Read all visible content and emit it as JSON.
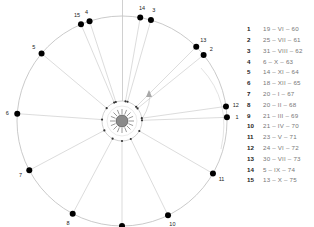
{
  "diagram": {
    "title": "",
    "center_label": "sun",
    "colors": {
      "orbit": "#bdbdbd",
      "line": "#c4c4c4",
      "point": "#000000",
      "sun_fill": "#8a8a8a",
      "sun_ray": "#555555",
      "label": "#222222",
      "arrow": "#a8a8a8"
    },
    "points": [
      {
        "id": "1",
        "angle_deg": 2
      },
      {
        "id": "2",
        "angle_deg": 39
      },
      {
        "id": "3",
        "angle_deg": 74
      },
      {
        "id": "4",
        "angle_deg": 108
      },
      {
        "id": "5",
        "angle_deg": 140
      },
      {
        "id": "6",
        "angle_deg": 176
      },
      {
        "id": "7",
        "angle_deg": 208
      },
      {
        "id": "8",
        "angle_deg": 242
      },
      {
        "id": "9",
        "angle_deg": 270
      },
      {
        "id": "10",
        "angle_deg": 296
      },
      {
        "id": "11",
        "angle_deg": 330
      },
      {
        "id": "12",
        "angle_deg": 8
      },
      {
        "id": "13",
        "angle_deg": 45
      },
      {
        "id": "14",
        "angle_deg": 80
      },
      {
        "id": "15",
        "angle_deg": 113
      }
    ]
  },
  "legend": {
    "items": [
      {
        "num": "1",
        "date": "19 – VI – 60"
      },
      {
        "num": "2",
        "date": "25 – VII – 61"
      },
      {
        "num": "3",
        "date": "31 – VIII – 62"
      },
      {
        "num": "4",
        "date": "6 – X – 63"
      },
      {
        "num": "5",
        "date": "14 – XI – 64"
      },
      {
        "num": "6",
        "date": "18 – XII – 65"
      },
      {
        "num": "7",
        "date": "20 – I – 67"
      },
      {
        "num": "8",
        "date": "20 – II – 68"
      },
      {
        "num": "9",
        "date": "21 – III – 69"
      },
      {
        "num": "10",
        "date": "21 – IV – 70"
      },
      {
        "num": "11",
        "date": "23 – V – 71"
      },
      {
        "num": "12",
        "date": "24 – VI – 72"
      },
      {
        "num": "13",
        "date": "30 – VII – 73"
      },
      {
        "num": "14",
        "date": "5 – IX – 74"
      },
      {
        "num": "15",
        "date": "13 – X – 75"
      }
    ]
  }
}
